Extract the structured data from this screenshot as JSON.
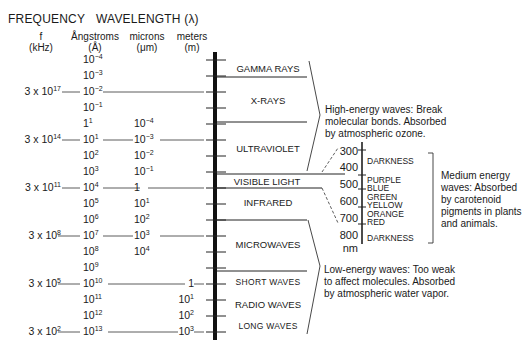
{
  "attribution": "Reproduction of an existing published electromagnetic spectrum figure",
  "headers": {
    "frequency": "FREQUENCY",
    "wavelength": "WAVELENGTH (λ)"
  },
  "columns": {
    "freq": {
      "line1": "f",
      "line2": "(kHz)"
    },
    "angstroms": {
      "line1": "Ångstroms",
      "line2": "(Å)"
    },
    "microns": {
      "line1": "microns",
      "line2": "(μm)"
    },
    "meters": {
      "line1": "meters",
      "line2": "(m)"
    }
  },
  "angstrom_rows": [
    {
      "base": "10",
      "exp": "−4"
    },
    {
      "base": "10",
      "exp": "−3"
    },
    {
      "base": "10",
      "exp": "−2"
    },
    {
      "base": "10",
      "exp": "−1"
    },
    {
      "base": "1",
      "exp": "1"
    },
    {
      "base": "10",
      "exp": "1"
    },
    {
      "base": "10",
      "exp": "2"
    },
    {
      "base": "10",
      "exp": "3"
    },
    {
      "base": "10",
      "exp": "4"
    },
    {
      "base": "10",
      "exp": "5"
    },
    {
      "base": "10",
      "exp": "6"
    },
    {
      "base": "10",
      "exp": "7"
    },
    {
      "base": "10",
      "exp": "8"
    },
    {
      "base": "10",
      "exp": "9"
    },
    {
      "base": "10",
      "exp": "10"
    },
    {
      "base": "10",
      "exp": "11"
    },
    {
      "base": "10",
      "exp": "12"
    },
    {
      "base": "10",
      "exp": "13"
    }
  ],
  "micron_rows": [
    {
      "row": 4,
      "base": "10",
      "exp": "−4"
    },
    {
      "row": 5,
      "base": "10",
      "exp": "−3"
    },
    {
      "row": 6,
      "base": "10",
      "exp": "−2"
    },
    {
      "row": 7,
      "base": "10",
      "exp": "−1"
    },
    {
      "row": 8,
      "base": "1",
      "exp": ""
    },
    {
      "row": 9,
      "base": "10",
      "exp": "1"
    },
    {
      "row": 10,
      "base": "10",
      "exp": "2"
    },
    {
      "row": 11,
      "base": "10",
      "exp": "3"
    },
    {
      "row": 12,
      "base": "10",
      "exp": "4"
    }
  ],
  "meter_rows": [
    {
      "row": 14,
      "base": "1",
      "exp": ""
    },
    {
      "row": 15,
      "base": "10",
      "exp": "1"
    },
    {
      "row": 16,
      "base": "10",
      "exp": "2"
    },
    {
      "row": 17,
      "base": "10",
      "exp": "3"
    }
  ],
  "frequency_rows": [
    {
      "row": 2,
      "base": "3 x 10",
      "exp": "17"
    },
    {
      "row": 5,
      "base": "3 x 10",
      "exp": "14"
    },
    {
      "row": 8,
      "base": "3 x 10",
      "exp": "11"
    },
    {
      "row": 11,
      "base": "3 x 10",
      "exp": "8"
    },
    {
      "row": 14,
      "base": "3 x 10",
      "exp": "5"
    },
    {
      "row": 17,
      "base": "3 x 10",
      "exp": "2"
    }
  ],
  "bands": [
    {
      "label": "GAMMA RAYS"
    },
    {
      "label": "X-RAYS"
    },
    {
      "label": "ULTRAVIOLET"
    },
    {
      "label": "VISIBLE LIGHT"
    },
    {
      "label": "INFRARED"
    },
    {
      "label": "MICROWAVES"
    },
    {
      "label": "SHORT  WAVES"
    },
    {
      "label": "RADIO WAVES"
    },
    {
      "label": "LONG  WAVES"
    }
  ],
  "notes": {
    "high": [
      "High-energy waves: Break",
      "molecular bonds. Absorbed",
      "by atmospheric ozone."
    ],
    "medium": [
      "Medium energy",
      "waves: Absorbed",
      "by carotenoid",
      "pigments in plants",
      "and animals."
    ],
    "low": [
      "Low-energy waves: Too weak",
      "to affect molecules. Absorbed",
      "by atmospheric water vapor."
    ]
  },
  "visible_scale": {
    "ticks": [
      "300",
      "400",
      "500",
      "600",
      "700",
      "800"
    ],
    "unit": "nm",
    "colors": [
      {
        "label": "DARKNESS"
      },
      {
        "label": "PURPLE"
      },
      {
        "label": "BLUE"
      },
      {
        "label": "GREEN"
      },
      {
        "label": "YELLOW"
      },
      {
        "label": "ORANGE"
      },
      {
        "label": "RED"
      },
      {
        "label": "DARKNESS"
      }
    ]
  }
}
